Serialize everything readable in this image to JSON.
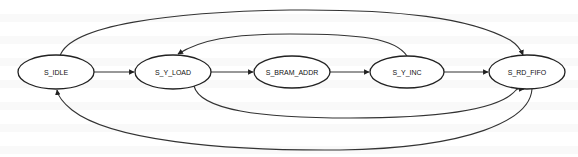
{
  "diagram": {
    "type": "state-machine",
    "colors": {
      "stroke": "#222222",
      "edge": "#333333",
      "text": "#111111",
      "fill": "#ffffff"
    },
    "nodes": [
      {
        "id": "idle",
        "label": "S_IDLE",
        "cx": 56,
        "cy": 72,
        "rx": 38,
        "ry": 17
      },
      {
        "id": "y_load",
        "label": "S_Y_LOAD",
        "cx": 173,
        "cy": 72,
        "rx": 38,
        "ry": 17
      },
      {
        "id": "bram_addr",
        "label": "S_BRAM_ADDR",
        "cx": 292,
        "cy": 72,
        "rx": 38,
        "ry": 16
      },
      {
        "id": "y_inc",
        "label": "S_Y_INC",
        "cx": 407,
        "cy": 72,
        "rx": 37,
        "ry": 16
      },
      {
        "id": "rd_fifo",
        "label": "S_RD_FIFO",
        "cx": 527,
        "cy": 72,
        "rx": 38,
        "ry": 17
      }
    ],
    "edges": [
      {
        "from": "S_IDLE",
        "to": "S_Y_LOAD",
        "route": "straight"
      },
      {
        "from": "S_Y_LOAD",
        "to": "S_BRAM_ADDR",
        "route": "straight"
      },
      {
        "from": "S_BRAM_ADDR",
        "to": "S_Y_INC",
        "route": "straight"
      },
      {
        "from": "S_Y_INC",
        "to": "S_RD_FIFO",
        "route": "straight"
      },
      {
        "from": "S_IDLE",
        "to": "S_RD_FIFO",
        "route": "top-arc"
      },
      {
        "from": "S_Y_INC",
        "to": "S_Y_LOAD",
        "route": "top-arc"
      },
      {
        "from": "S_Y_LOAD",
        "to": "S_RD_FIFO",
        "route": "bottom-arc"
      },
      {
        "from": "S_RD_FIFO",
        "to": "S_IDLE",
        "route": "bottom-arc"
      }
    ]
  }
}
